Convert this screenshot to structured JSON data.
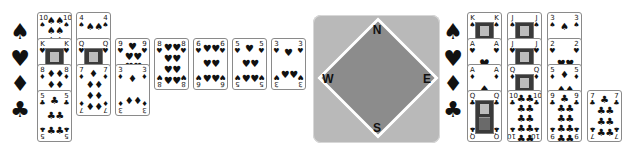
{
  "suits": [
    "♠",
    "♥",
    "♦",
    "♣"
  ],
  "suit_names": [
    "spades",
    "hearts",
    "diamonds",
    "clubs"
  ],
  "compass": {
    "north": "N",
    "south": "S",
    "east": "E",
    "west": "W"
  },
  "colors": {
    "background": "#ffffff",
    "frame": "#b9b9b9",
    "diamond": "#8c8c8c",
    "card_border": "#8a8a8a"
  },
  "left_hand": {
    "spades": [
      {
        "rank": "10",
        "suit": "♠"
      },
      {
        "rank": "4",
        "suit": "♠"
      }
    ],
    "hearts": [
      {
        "rank": "K",
        "suit": "♥"
      },
      {
        "rank": "Q",
        "suit": "♥"
      },
      {
        "rank": "9",
        "suit": "♥"
      },
      {
        "rank": "8",
        "suit": "♥"
      },
      {
        "rank": "6",
        "suit": "♥"
      },
      {
        "rank": "5",
        "suit": "♥"
      },
      {
        "rank": "3",
        "suit": "♥"
      }
    ],
    "diamonds": [
      {
        "rank": "8",
        "suit": "♦"
      },
      {
        "rank": "7",
        "suit": "♦"
      },
      {
        "rank": "3",
        "suit": "♦"
      }
    ],
    "clubs": [
      {
        "rank": "5",
        "suit": "♣"
      }
    ]
  },
  "right_hand": {
    "spades": [
      {
        "rank": "K",
        "suit": "♠"
      },
      {
        "rank": "J",
        "suit": "♠"
      },
      {
        "rank": "3",
        "suit": "♠"
      }
    ],
    "hearts": [
      {
        "rank": "A",
        "suit": "♥"
      },
      {
        "rank": "J",
        "suit": "♥"
      },
      {
        "rank": "2",
        "suit": "♥"
      }
    ],
    "diamonds": [
      {
        "rank": "A",
        "suit": "♦"
      },
      {
        "rank": "Q",
        "suit": "♦"
      },
      {
        "rank": "5",
        "suit": "♦"
      }
    ],
    "clubs": [
      {
        "rank": "Q",
        "suit": "♣"
      },
      {
        "rank": "10",
        "suit": "♣"
      },
      {
        "rank": "9",
        "suit": "♣"
      },
      {
        "rank": "7",
        "suit": "♣"
      }
    ]
  }
}
